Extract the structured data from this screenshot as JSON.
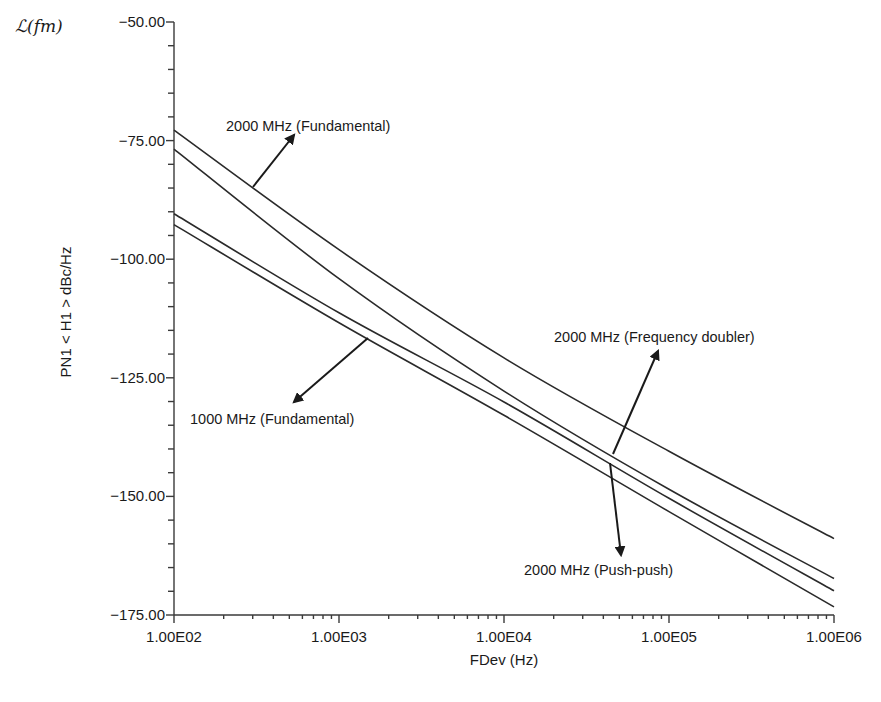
{
  "chart_data": {
    "type": "line",
    "title": "",
    "xlabel": "FDev (Hz)",
    "ylabel": "PN1 < H1 >  dBc/Hz",
    "corner_symbol": "ℒ(fm)",
    "xscale": "log",
    "xlim": [
      100,
      1000000
    ],
    "ylim": [
      -175,
      -50
    ],
    "grid": false,
    "legend": "none (inline annotations with arrows)",
    "x_ticks": [
      {
        "value": 100,
        "label": "1.00E02"
      },
      {
        "value": 1000,
        "label": "1.00E03"
      },
      {
        "value": 10000,
        "label": "1.00E04"
      },
      {
        "value": 100000,
        "label": "1.00E05"
      },
      {
        "value": 1000000,
        "label": "1.00E06"
      }
    ],
    "y_ticks": [
      {
        "value": -50,
        "label": "-50.00"
      },
      {
        "value": -75,
        "label": "-75.00"
      },
      {
        "value": -100,
        "label": "-100.00"
      },
      {
        "value": -125,
        "label": "-125.00"
      },
      {
        "value": -150,
        "label": "-150.00"
      },
      {
        "value": -175,
        "label": "-175.00"
      }
    ],
    "y_minor_step": 5,
    "x": [
      100,
      1000,
      10000,
      100000,
      1000000
    ],
    "series": [
      {
        "name": "2000 MHz (Fundamental)",
        "values": [
          -72.8,
          -98.0,
          -120.8,
          -140.5,
          -158.9
        ]
      },
      {
        "name": "2000 MHz (Frequency doubler)",
        "values": [
          -76.8,
          -104.1,
          -127.8,
          -148.5,
          -167.3
        ]
      },
      {
        "name": "2000 MHz (Push-push)",
        "values": [
          -90.4,
          -111.3,
          -130.1,
          -150.4,
          -169.9
        ]
      },
      {
        "name": "1000 MHz (Fundamental)",
        "values": [
          -92.7,
          -113.4,
          -132.9,
          -153.2,
          -173.3
        ]
      }
    ],
    "annotations": [
      {
        "text": "2000 MHz (Fundamental)",
        "series": 0,
        "text_x": 226,
        "text_y": 131,
        "arrow_from": [
          253,
          187
        ],
        "arrow_to": [
          294,
          135
        ]
      },
      {
        "text": "2000 MHz (Frequency doubler)",
        "series": 1,
        "text_x": 554,
        "text_y": 342,
        "arrow_from": [
          613,
          454
        ],
        "arrow_to": [
          658,
          351
        ]
      },
      {
        "text": "2000 MHz (Push-push)",
        "series": 2,
        "text_x": 524,
        "text_y": 575,
        "arrow_from": [
          610,
          463
        ],
        "arrow_to": [
          621,
          555
        ]
      },
      {
        "text": "1000 MHz (Fundamental)",
        "series": 3,
        "text_x": 190,
        "text_y": 424,
        "arrow_from": [
          368,
          338
        ],
        "arrow_to": [
          294,
          402
        ]
      }
    ]
  },
  "colors": {
    "background": "#ffffff",
    "ink": "#1a1a1a",
    "curve": "#2a2a2a",
    "axis": "#3a3a3a"
  }
}
